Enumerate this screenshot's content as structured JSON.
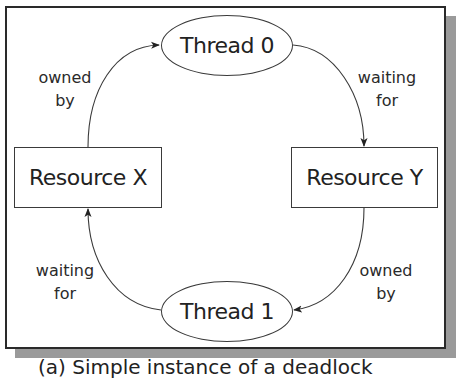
{
  "figure": {
    "caption": "(a) Simple instance of a deadlock"
  },
  "nodes": {
    "thread0": {
      "label": "Thread 0",
      "shape": "ellipse"
    },
    "thread1": {
      "label": "Thread 1",
      "shape": "ellipse"
    },
    "resourceX": {
      "label": "Resource X",
      "shape": "rectangle"
    },
    "resourceY": {
      "label": "Resource Y",
      "shape": "rectangle"
    }
  },
  "edges": [
    {
      "from": "resourceX",
      "to": "thread0",
      "label_line1": "owned",
      "label_line2": "by"
    },
    {
      "from": "thread0",
      "to": "resourceY",
      "label_line1": "waiting",
      "label_line2": "for"
    },
    {
      "from": "resourceY",
      "to": "thread1",
      "label_line1": "owned",
      "label_line2": "by"
    },
    {
      "from": "thread1",
      "to": "resourceX",
      "label_line1": "waiting",
      "label_line2": "for"
    }
  ],
  "colors": {
    "stroke": "#3a3a3a",
    "shadow": "#9a9a9a",
    "text": "#222222"
  }
}
